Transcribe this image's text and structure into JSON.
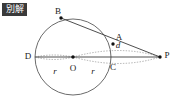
{
  "figure": {
    "badge": {
      "text": "別解",
      "bg": "#3a3a3a",
      "fg": "#ffffff"
    },
    "canvas": {
      "width": 175,
      "height": 100,
      "background": "#ffffff"
    },
    "colors": {
      "stroke": "#5a5a5a",
      "line": "#3a3a3a",
      "dotted": "#9a9a9a",
      "point": "#111111",
      "label": "#1a1a1a"
    },
    "circle": {
      "cx": 73,
      "cy": 57,
      "r": 38,
      "label": "O"
    },
    "points": [
      {
        "name": "B",
        "x": 61,
        "y": 18,
        "label": "B",
        "label_x": 58,
        "label_y": 11,
        "dot": true
      },
      {
        "name": "A",
        "x": 113,
        "y": 44,
        "label": "A",
        "label_x": 119,
        "label_y": 37,
        "dot": true
      },
      {
        "name": "P",
        "x": 160,
        "y": 57,
        "label": "P",
        "label_x": 167,
        "label_y": 55,
        "dot": true
      },
      {
        "name": "D",
        "x": 35,
        "y": 57,
        "label": "D",
        "label_x": 28,
        "label_y": 56,
        "dot": false
      },
      {
        "name": "O",
        "x": 73,
        "y": 57,
        "label": "O",
        "label_x": 73,
        "label_y": 68,
        "dot": true
      },
      {
        "name": "C",
        "x": 111,
        "y": 57,
        "label": "C",
        "label_x": 113,
        "label_y": 67,
        "dot": false
      }
    ],
    "segments": [
      {
        "name": "chord-B-to-P",
        "from": "B",
        "to": "P",
        "style": "solid"
      },
      {
        "name": "diameter-D-to-P",
        "from": "D",
        "to": "P",
        "style": "solid"
      }
    ],
    "measures": [
      {
        "name": "radius-left",
        "label": "r",
        "x": 55,
        "y": 71
      },
      {
        "name": "radius-right",
        "label": "r",
        "x": 93,
        "y": 71
      },
      {
        "name": "distance-d",
        "label": "d",
        "x": 118,
        "y": 45
      }
    ],
    "dotted_arcs": [
      {
        "name": "arc-upper-O-to-P"
      },
      {
        "name": "arc-lower-O-to-P"
      },
      {
        "name": "arc-upper-D-to-O"
      },
      {
        "name": "arc-lower-D-to-O"
      }
    ]
  }
}
